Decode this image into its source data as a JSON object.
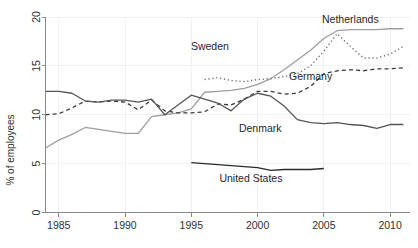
{
  "chart_data": {
    "type": "line",
    "title": "",
    "xlabel": "",
    "ylabel": "% of employees",
    "xlim": [
      1984,
      2011.5
    ],
    "ylim": [
      0,
      20
    ],
    "xticks": [
      1985,
      1990,
      1995,
      2000,
      2005,
      2010
    ],
    "xtick_labels": [
      "1985",
      "1990",
      "1995",
      "2000",
      "2005",
      "2010"
    ],
    "yticks": [
      0,
      5,
      10,
      15,
      20
    ],
    "ytick_labels": [
      "0",
      "5",
      "10",
      "15",
      "20"
    ],
    "grid": false,
    "legend_position": "inline-annotations",
    "series": [
      {
        "name": "Netherlands",
        "style": "solid",
        "color": "#9e9e9e",
        "width": 1.3,
        "label_x": 2007.0,
        "label_y": 19.4,
        "x": [
          1984,
          1985,
          1986,
          1987,
          1988,
          1989,
          1990,
          1991,
          1992,
          1993,
          1994,
          1995,
          1996,
          1997,
          1998,
          1999,
          2000,
          2001,
          2002,
          2003,
          2004,
          2005,
          2006,
          2007,
          2008,
          2009,
          2010,
          2011
        ],
        "values": [
          6.6,
          7.4,
          8.0,
          8.7,
          8.5,
          8.3,
          8.1,
          8.1,
          9.8,
          10.0,
          10.2,
          10.6,
          12.3,
          12.4,
          12.5,
          12.7,
          13.1,
          13.7,
          14.6,
          15.6,
          16.6,
          17.8,
          18.6,
          18.7,
          18.7,
          18.7,
          18.8,
          18.8
        ]
      },
      {
        "name": "Sweden",
        "style": "dotted",
        "color": "#6e6e6e",
        "width": 1.4,
        "label_x": 1996.4,
        "label_y": 16.6,
        "x": [
          1996,
          1997,
          1998,
          1999,
          2000,
          2001,
          2002,
          2003,
          2004,
          2005,
          2006,
          2007,
          2008,
          2009,
          2010,
          2011
        ],
        "values": [
          13.6,
          13.8,
          13.5,
          13.4,
          13.6,
          13.7,
          13.9,
          14.2,
          15.0,
          16.5,
          18.3,
          17.0,
          15.8,
          15.8,
          16.2,
          17.0
        ]
      },
      {
        "name": "Germany",
        "style": "dashed",
        "color": "#3a3a3a",
        "width": 1.3,
        "label_x": 2004.0,
        "label_y": 13.6,
        "x": [
          1984,
          1985,
          1986,
          1987,
          1988,
          1989,
          1990,
          1991,
          1992,
          1993,
          1994,
          1995,
          1996,
          1997,
          1998,
          1999,
          2000,
          2001,
          2002,
          2003,
          2004,
          2005,
          2006,
          2007,
          2008,
          2009,
          2010,
          2011
        ],
        "values": [
          10.0,
          10.1,
          10.7,
          11.4,
          11.3,
          11.4,
          11.3,
          10.5,
          11.5,
          10.4,
          10.2,
          10.2,
          10.3,
          11.1,
          11.0,
          11.6,
          12.4,
          12.4,
          12.1,
          12.2,
          12.9,
          14.2,
          14.5,
          14.6,
          14.5,
          14.7,
          14.7,
          14.8
        ]
      },
      {
        "name": "Denmark",
        "style": "solid",
        "color": "#555555",
        "width": 1.3,
        "label_x": 2000.2,
        "label_y": 8.2,
        "x": [
          1984,
          1985,
          1986,
          1987,
          1988,
          1989,
          1990,
          1991,
          1992,
          1993,
          1994,
          1995,
          1996,
          1997,
          1998,
          1999,
          2000,
          2001,
          2002,
          2003,
          2004,
          2005,
          2006,
          2007,
          2008,
          2009,
          2010,
          2011
        ],
        "values": [
          12.4,
          12.4,
          12.2,
          11.4,
          11.3,
          11.5,
          11.5,
          11.3,
          11.6,
          10.0,
          11.0,
          12.0,
          11.6,
          11.2,
          10.4,
          11.6,
          12.2,
          11.9,
          10.9,
          9.5,
          9.2,
          9.1,
          9.2,
          9.0,
          8.9,
          8.6,
          9.0,
          9.0
        ]
      },
      {
        "name": "United States",
        "style": "solid",
        "color": "#2b2b2b",
        "width": 1.3,
        "label_x": 1999.5,
        "label_y": 3.1,
        "x": [
          1995,
          1996,
          1997,
          1998,
          1999,
          2000,
          2001,
          2002,
          2003,
          2004,
          2005
        ],
        "values": [
          5.1,
          5.0,
          4.9,
          4.8,
          4.7,
          4.6,
          4.3,
          4.4,
          4.4,
          4.4,
          4.5
        ]
      }
    ]
  }
}
